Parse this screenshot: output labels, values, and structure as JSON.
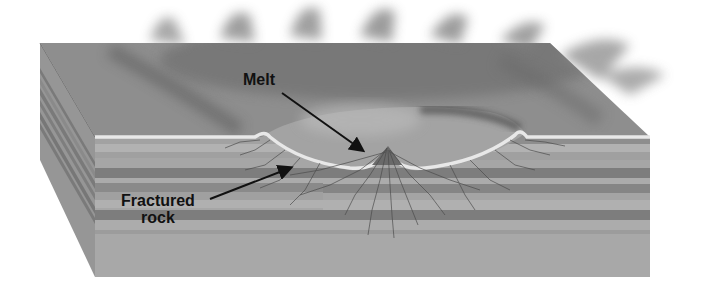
{
  "figure": {
    "type": "block-diagram",
    "labels": {
      "melt": "Melt",
      "fractured_line1": "Fractured",
      "fractured_line2": "rock"
    },
    "colors": {
      "background": "#ffffff",
      "top_surface": "#8e8e8e",
      "ejecta_dark": "#555555",
      "crater_floor": "#a3a3a3",
      "crater_rim": "#e8e8e8",
      "layer_light": "#a8a8a8",
      "layer_mid": "#9a9a9a",
      "layer_dark": "#7a7a7a",
      "base": "#a6a6a6",
      "side_face": "#969696",
      "fracture_lines": "#4a4a4a",
      "arrow": "#111111"
    }
  }
}
